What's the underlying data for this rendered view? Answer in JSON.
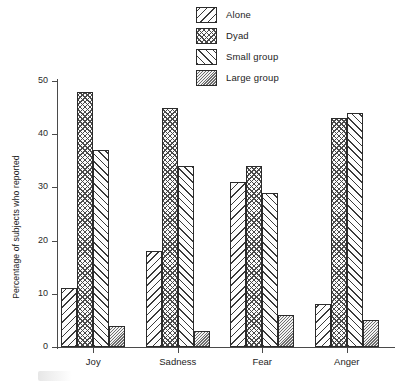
{
  "chart_data": {
    "type": "bar",
    "title": "",
    "xlabel": "",
    "ylabel": "Percentage of subjects who reported",
    "categories": [
      "Joy",
      "Sadness",
      "Fear",
      "Anger"
    ],
    "series": [
      {
        "name": "Alone",
        "pattern": "diagonal-backslash-hatch",
        "values": [
          11,
          18,
          31,
          8
        ]
      },
      {
        "name": "Dyad",
        "pattern": "cross-hatch",
        "values": [
          48,
          45,
          34,
          43
        ]
      },
      {
        "name": "Small group",
        "pattern": "diagonal-slash-hatch",
        "values": [
          37,
          34,
          29,
          44
        ]
      },
      {
        "name": "Large group",
        "pattern": "dense-fine-hatch",
        "values": [
          4,
          3,
          6,
          5
        ]
      }
    ],
    "ylim": [
      0,
      50
    ],
    "yticks": [
      0,
      10,
      20,
      30,
      40,
      50
    ],
    "ytick_labels": [
      "0",
      "10",
      "20",
      "30",
      "40",
      "50"
    ],
    "grid": false,
    "legend_position": "top-center",
    "axis_color": "#4a4a4a",
    "bar_edge_color": "#2b2b2b"
  },
  "legend": {
    "items": [
      {
        "label": "Alone"
      },
      {
        "label": "Dyad"
      },
      {
        "label": "Small group"
      },
      {
        "label": "Large group"
      }
    ]
  }
}
